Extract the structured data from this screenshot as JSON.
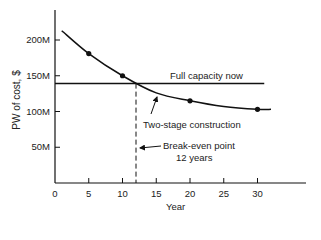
{
  "chart_data": {
    "type": "line",
    "title": "",
    "xlabel": "Year",
    "ylabel": "PW of cost, $",
    "xlim": [
      0,
      35
    ],
    "ylim": [
      0,
      225
    ],
    "x_ticks": [
      "0",
      "5",
      "10",
      "15",
      "20",
      "25",
      "30"
    ],
    "y_ticks": [
      "50M",
      "100M",
      "150M",
      "200M"
    ],
    "grid": false,
    "legend": "none (inline labels)",
    "series": [
      {
        "name": "Full capacity now",
        "style": "solid horizontal line",
        "x": [
          0,
          31
        ],
        "y": [
          139,
          139
        ]
      },
      {
        "name": "Two-stage construction",
        "style": "solid curve with markers",
        "x": [
          1,
          5,
          10,
          15,
          20,
          25,
          30,
          32
        ],
        "y": [
          213,
          181,
          150,
          126,
          115,
          107,
          103,
          103
        ],
        "markers": [
          {
            "x": 5,
            "y": 181
          },
          {
            "x": 10,
            "y": 150
          },
          {
            "x": 20,
            "y": 115
          },
          {
            "x": 30,
            "y": 103
          }
        ]
      }
    ],
    "annotations": [
      {
        "text": "Full capacity now",
        "target": "horizontal line"
      },
      {
        "text": "Two-stage construction",
        "target": "curve",
        "arrow": true
      },
      {
        "text": "Break-even point\n12 years",
        "target": "dashed vertical line at x=12",
        "arrow": true
      }
    ],
    "break_even": {
      "x": 12,
      "y": 139,
      "label_line1": "Break-even point",
      "label_line2": "12 years"
    }
  },
  "labels": {
    "ylabel": "PW of cost, $",
    "xlabel": "Year",
    "full_capacity": "Full capacity now",
    "two_stage": "Two-stage construction",
    "break_even_1": "Break-even point",
    "break_even_2": "12 years"
  },
  "colors": {
    "ink": "#111111",
    "background": "#ffffff"
  }
}
